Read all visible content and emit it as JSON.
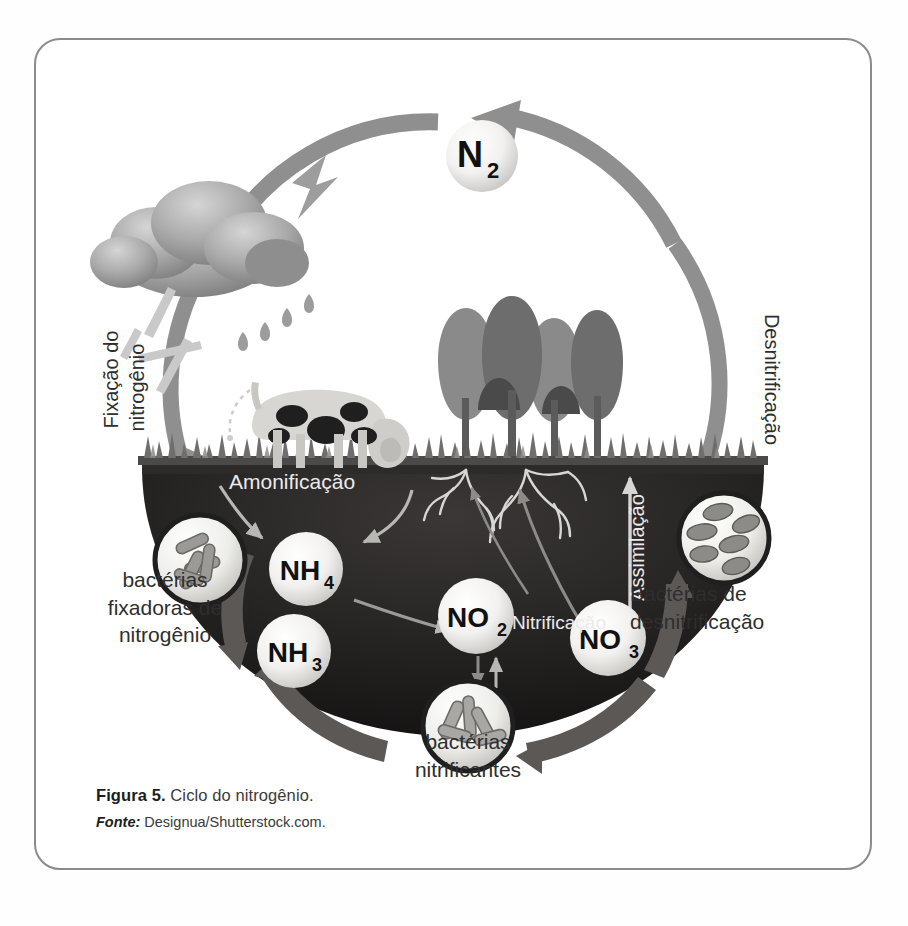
{
  "figure": {
    "caption_label": "Figura 5.",
    "caption_text": " Ciclo do nitrogênio.",
    "source_label": "Fonte:",
    "source_text": " Designua/Shutterstock.com."
  },
  "diagram": {
    "title": "Ciclo do nitrogênio",
    "cycle_direction": "counterclockwise",
    "labels": {
      "n2": "N",
      "n2_sub": "2",
      "nh4": "NH",
      "nh4_sub": "4",
      "nh3": "NH",
      "nh3_sub": "3",
      "no2": "NO",
      "no2_sub": "2",
      "no3": "NO",
      "no3_sub": "3",
      "fixacao": "Fixação do",
      "fixacao_line2": "nitrogênio",
      "desnitrificacao_arc": "Desnitrificação",
      "amonificacao": "Amonificação",
      "nitrificacao": "Nitrificação",
      "assimilacao": "Assimilação",
      "bact_fix_l1": "bactérias",
      "bact_fix_l2": "fixadoras de",
      "bact_fix_l3": "nitrogênio",
      "bact_nitr_l1": "bactérias",
      "bact_nitr_l2": "nitrificantes",
      "bact_desn_l1": "Bactérias de",
      "bact_desn_l2": "desnitrificação"
    },
    "icons": {
      "cloud": "rain-cloud-icon",
      "lightning": "lightning-icon",
      "raindrops": "raindrop-icon",
      "cow": "cow-icon",
      "trees": "tree-icon",
      "grass": "grass-icon",
      "roots": "plant-roots-icon",
      "bacteria_rod": "rod-bacteria-icon",
      "bacteria_oval": "oval-bacteria-icon",
      "bacteria_cluster": "bacteria-cluster-icon",
      "cycle_arrow": "cycle-arrow-icon"
    },
    "colors": {
      "frame": "#8b8b8b",
      "arc_ring": "#8f8f8f",
      "soil": "#211f1f",
      "sphere": "#f4f4f2",
      "text_dark": "#2e2e2e",
      "text_light": "#eceaea",
      "cloud": "#9a9a9a",
      "tree": "#7b7b7b",
      "grass": "#6e6e6e"
    }
  }
}
